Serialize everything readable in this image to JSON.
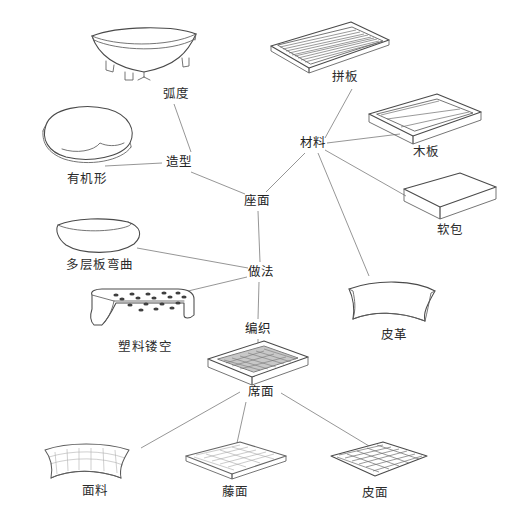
{
  "diagram": {
    "line_color": "#8a8a8a",
    "ink_color": "#4a4a4a",
    "background": "#ffffff",
    "hubs": [
      {
        "id": "zuomian",
        "label": "座面",
        "x": 257,
        "y": 201
      },
      {
        "id": "zaoxing",
        "label": "造型",
        "x": 179,
        "y": 162
      },
      {
        "id": "cailiao",
        "label": "材料",
        "x": 313,
        "y": 143
      },
      {
        "id": "zuofa",
        "label": "做法",
        "x": 261,
        "y": 272
      },
      {
        "id": "bianzhi",
        "label": "编织",
        "x": 258,
        "y": 329
      },
      {
        "id": "ximian",
        "label": "席面",
        "x": 261,
        "y": 392
      }
    ],
    "leaves": [
      {
        "id": "hudu",
        "label": "弧度",
        "x": 176,
        "y": 94,
        "parent": "zaoxing"
      },
      {
        "id": "youjixing",
        "label": "有机形",
        "x": 87,
        "y": 179,
        "parent": "zaoxing"
      },
      {
        "id": "pinban",
        "label": "拼板",
        "x": 345,
        "y": 77,
        "parent": "cailiao"
      },
      {
        "id": "muban",
        "label": "木板",
        "x": 426,
        "y": 152,
        "parent": "cailiao"
      },
      {
        "id": "ruanbao",
        "label": "软包",
        "x": 450,
        "y": 230,
        "parent": "cailiao"
      },
      {
        "id": "pige",
        "label": "皮革",
        "x": 394,
        "y": 335,
        "parent": "cailiao"
      },
      {
        "id": "duocengban",
        "label": "多层板弯曲",
        "x": 100,
        "y": 265,
        "parent": "zuofa"
      },
      {
        "id": "sulialoukong",
        "label": "塑料镂空",
        "x": 145,
        "y": 347,
        "parent": "zuofa"
      },
      {
        "id": "mianliao",
        "label": "面料",
        "x": 95,
        "y": 491,
        "parent": "ximian"
      },
      {
        "id": "tengmian",
        "label": "藤面",
        "x": 235,
        "y": 492,
        "parent": "ximian"
      },
      {
        "id": "pimian",
        "label": "皮面",
        "x": 375,
        "y": 493,
        "parent": "ximian"
      }
    ],
    "edges": [
      {
        "from": "hudu",
        "to": "zaoxing"
      },
      {
        "from": "youjixing",
        "to": "zaoxing"
      },
      {
        "from": "zaoxing",
        "to": "zuomian"
      },
      {
        "from": "zuomian",
        "to": "cailiao"
      },
      {
        "from": "cailiao",
        "to": "pinban"
      },
      {
        "from": "cailiao",
        "to": "muban"
      },
      {
        "from": "cailiao",
        "to": "ruanbao"
      },
      {
        "from": "cailiao",
        "to": "pige"
      },
      {
        "from": "zuomian",
        "to": "zuofa"
      },
      {
        "from": "zuofa",
        "to": "duocengban"
      },
      {
        "from": "zuofa",
        "to": "sulialoukong"
      },
      {
        "from": "zuofa",
        "to": "bianzhi"
      },
      {
        "from": "bianzhi",
        "to": "ximian"
      },
      {
        "from": "ximian",
        "to": "mianliao"
      },
      {
        "from": "ximian",
        "to": "tengmian"
      },
      {
        "from": "ximian",
        "to": "pimian"
      }
    ],
    "illustrations": [
      {
        "id": "illus-hudu",
        "name": "curved-dish-seat-sketch",
        "caption": "弧度",
        "x": 144,
        "y": 53
      },
      {
        "id": "illus-youjixing",
        "name": "organic-blob-seat-sketch",
        "caption": "有机形",
        "x": 87,
        "y": 134
      },
      {
        "id": "illus-pinban",
        "name": "slatted-wood-panel-sketch",
        "caption": "拼板",
        "x": 330,
        "y": 48
      },
      {
        "id": "illus-muban",
        "name": "wood-board-tray-sketch",
        "caption": "木板",
        "x": 425,
        "y": 119
      },
      {
        "id": "illus-ruanbao",
        "name": "soft-cushion-pad-sketch",
        "caption": "软包",
        "x": 450,
        "y": 196
      },
      {
        "id": "illus-pige",
        "name": "leather-sheet-sketch",
        "caption": "皮革",
        "x": 392,
        "y": 303
      },
      {
        "id": "illus-duocengban",
        "name": "bent-plywood-shell-sketch",
        "caption": "多层板弯曲",
        "x": 100,
        "y": 237
      },
      {
        "id": "illus-loukong",
        "name": "perforated-plastic-sketch",
        "caption": "塑料镂空",
        "x": 143,
        "y": 310
      },
      {
        "id": "illus-ximian",
        "name": "woven-mat-tray-sketch",
        "caption": "席面",
        "x": 258,
        "y": 362
      },
      {
        "id": "illus-mianliao",
        "name": "fabric-swatch-sketch",
        "caption": "面料",
        "x": 95,
        "y": 462
      },
      {
        "id": "illus-tengmian",
        "name": "rattan-panel-sketch",
        "caption": "藤面",
        "x": 237,
        "y": 461
      },
      {
        "id": "illus-pimian",
        "name": "woven-leather-grid-sketch",
        "caption": "皮面",
        "x": 379,
        "y": 461
      }
    ]
  }
}
